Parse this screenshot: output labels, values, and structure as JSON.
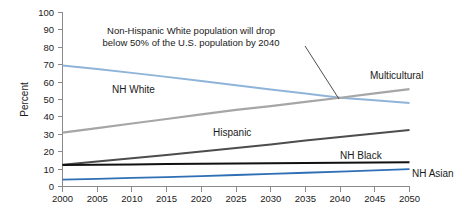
{
  "chart_data": {
    "type": "line",
    "title": "",
    "xlabel": "",
    "ylabel": "Percent",
    "xlim": [
      2000,
      2050
    ],
    "ylim": [
      0,
      100
    ],
    "grid": false,
    "legend_position": "inline-labels",
    "x": [
      2000,
      2005,
      2010,
      2015,
      2020,
      2025,
      2030,
      2035,
      2040,
      2045,
      2050
    ],
    "xtick_labels": [
      "2000",
      "2005",
      "2010",
      "2015",
      "2020",
      "2025",
      "2030",
      "2035",
      "2040",
      "2045",
      "2050"
    ],
    "ytick_labels": [
      "0",
      "10",
      "20",
      "30",
      "40",
      "50",
      "60",
      "70",
      "80",
      "90",
      "100"
    ],
    "ytick_values": [
      0,
      10,
      20,
      30,
      40,
      50,
      60,
      70,
      80,
      90,
      100
    ],
    "series": [
      {
        "name": "NH White",
        "color": "#8fb4d9",
        "width": 2.0,
        "values": [
          69.5,
          67.5,
          65.3,
          63.0,
          60.6,
          58.2,
          55.8,
          53.4,
          51.0,
          49.5,
          48.0
        ]
      },
      {
        "name": "Multicultural",
        "color": "#a6a6a6",
        "width": 2.2,
        "values": [
          31.0,
          33.6,
          36.2,
          38.8,
          41.4,
          44.0,
          46.2,
          48.6,
          51.0,
          53.5,
          56.0
        ]
      },
      {
        "name": "Hispanic",
        "color": "#4d4d4d",
        "width": 2.0,
        "values": [
          12.5,
          14.3,
          16.2,
          18.1,
          20.1,
          22.1,
          24.2,
          26.4,
          28.5,
          30.5,
          32.5
        ]
      },
      {
        "name": "NH Black",
        "color": "#111111",
        "width": 2.0,
        "values": [
          12.3,
          12.5,
          12.7,
          12.9,
          13.1,
          13.2,
          13.4,
          13.5,
          13.6,
          13.8,
          14.0
        ]
      },
      {
        "name": "NH Asian",
        "color": "#2f6fb5",
        "width": 1.8,
        "values": [
          4.0,
          4.4,
          4.9,
          5.4,
          6.0,
          6.6,
          7.2,
          7.9,
          8.6,
          9.3,
          10.0
        ]
      }
    ],
    "annotations": [
      {
        "id": "white-below-50",
        "line1": "Non-Hispanic White population will drop",
        "line2": "below 50% of the U.S. population by 2040",
        "points_to_year": 2040,
        "points_to_value": 51
      }
    ],
    "series_labels": [
      {
        "name": "NH White",
        "text": "NH White"
      },
      {
        "name": "Multicultural",
        "text": "Multicultural"
      },
      {
        "name": "Hispanic",
        "text": "Hispanic"
      },
      {
        "name": "NH Black",
        "text": "NH Black"
      },
      {
        "name": "NH Asian",
        "text": "NH Asian"
      }
    ]
  }
}
